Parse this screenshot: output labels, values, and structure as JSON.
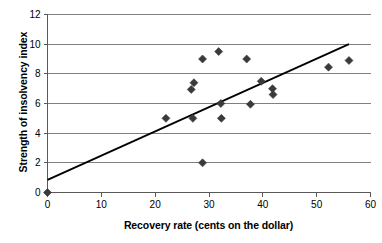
{
  "chart_data": {
    "type": "scatter",
    "title": "",
    "xlabel": "Recovery rate (cents on the dollar)",
    "ylabel": "Strength of insolvency index",
    "xlim": [
      0,
      60
    ],
    "ylim": [
      0,
      12
    ],
    "xticks": [
      0,
      10,
      20,
      30,
      40,
      50,
      60
    ],
    "yticks": [
      0,
      2,
      4,
      6,
      8,
      10,
      12
    ],
    "xtick_labels": [
      "0",
      "10",
      "20",
      "30",
      "40",
      "50",
      "60"
    ],
    "ytick_labels": [
      "0",
      "2",
      "4",
      "6",
      "8",
      "10",
      "12"
    ],
    "grid": "horizontal",
    "legend": "none",
    "marker": "diamond",
    "marker_color": "#3a3a3a",
    "line_color": "#000000",
    "grid_color": "#808080",
    "axis_color": "#595959",
    "points": [
      {
        "x": 0,
        "y": 0.0
      },
      {
        "x": 22.0,
        "y": 5.0
      },
      {
        "x": 26.7,
        "y": 6.95
      },
      {
        "x": 27.0,
        "y": 5.0
      },
      {
        "x": 27.2,
        "y": 7.4
      },
      {
        "x": 28.8,
        "y": 9.0
      },
      {
        "x": 28.8,
        "y": 2.0
      },
      {
        "x": 31.8,
        "y": 9.5
      },
      {
        "x": 32.2,
        "y": 6.0
      },
      {
        "x": 32.3,
        "y": 5.0
      },
      {
        "x": 37.0,
        "y": 9.0
      },
      {
        "x": 37.7,
        "y": 5.95
      },
      {
        "x": 39.7,
        "y": 7.5
      },
      {
        "x": 41.8,
        "y": 7.0
      },
      {
        "x": 41.9,
        "y": 6.6
      },
      {
        "x": 52.2,
        "y": 8.45
      },
      {
        "x": 56.0,
        "y": 8.9
      }
    ],
    "trendline": {
      "x0": 0,
      "y0": 0.85,
      "x1": 56,
      "y1": 10.0
    }
  }
}
